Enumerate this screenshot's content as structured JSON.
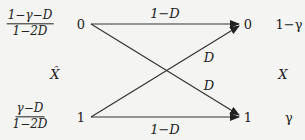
{
  "diagram": {
    "type": "binary-channel",
    "input_variable": "X̂",
    "output_variable": "X",
    "input_priors": [
      {
        "numerator": "1−γ−D",
        "denominator": "1−2D"
      },
      {
        "numerator": "γ−D",
        "denominator": "1−2D"
      }
    ],
    "input_nodes": [
      "0",
      "1"
    ],
    "output_nodes": [
      "0",
      "1"
    ],
    "output_probabilities": [
      "1−γ",
      "γ"
    ],
    "edges": [
      {
        "from": "0",
        "to": "0",
        "label": "1−D"
      },
      {
        "from": "0",
        "to": "1",
        "label": "D"
      },
      {
        "from": "1",
        "to": "0",
        "label": "D"
      },
      {
        "from": "1",
        "to": "1",
        "label": "1−D"
      }
    ],
    "colors": {
      "line": "#333333",
      "text": "#222222",
      "background": "#f4f4f2"
    }
  }
}
